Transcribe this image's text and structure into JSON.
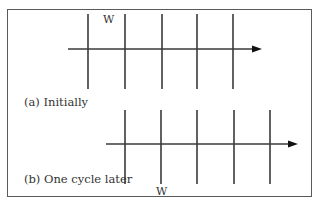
{
  "figure": {
    "panels": [
      {
        "caption": "(a) Initially",
        "marker_label": "W",
        "axis_y": 49,
        "axis_x_start": 68,
        "axis_x_end": 262,
        "line_top": 14,
        "line_bottom": 89,
        "lines_x": [
          88,
          125,
          162,
          197,
          233
        ]
      },
      {
        "caption": "(b) One cycle later",
        "marker_label": "W",
        "axis_y": 144,
        "axis_x_start": 106,
        "axis_x_end": 298,
        "line_top": 110,
        "line_bottom": 184,
        "lines_x": [
          125,
          161,
          197,
          234,
          270
        ]
      }
    ],
    "colors": {
      "line": "#3a3a3a",
      "border": "#5a5a5a",
      "text": "#333333"
    }
  }
}
